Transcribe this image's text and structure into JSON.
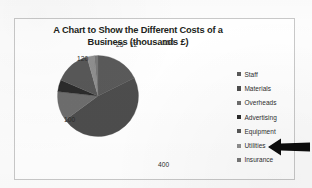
{
  "chart_data": {
    "type": "pie",
    "title": "A Chart to Show the Different Costs of a Business (thousands £)",
    "title_line1": "A Chart to Show the Different Costs of a",
    "title_line2": "Business (thousands £)",
    "unit": "thousands £",
    "categories": [
      "Staff",
      "Materials",
      "Overheads",
      "Advertising",
      "Equipment",
      "Utilities",
      "Insurance"
    ],
    "values": [
      150,
      400,
      100,
      40,
      120,
      25,
      12
    ],
    "total": 847,
    "legend_position": "right",
    "grid": false,
    "labels_shown": true,
    "slices": [
      {
        "name": "Staff",
        "value": 150,
        "label": "150",
        "color": "#5a5a5a",
        "label_x": 148,
        "label_y": 20
      },
      {
        "name": "Materials",
        "value": 400,
        "label": "400",
        "color": "#4d4d4d",
        "label_x": 143,
        "label_y": 142
      },
      {
        "name": "Overheads",
        "value": 100,
        "label": "100",
        "color": "#6e6e6e",
        "label_x": 49,
        "label_y": 97
      },
      {
        "name": "Advertising",
        "value": 40,
        "label": "40",
        "color": "#2b2b2b",
        "label_x": 52,
        "label_y": 68
      },
      {
        "name": "Equipment",
        "value": 120,
        "label": "120",
        "color": "#585858",
        "label_x": 62,
        "label_y": 36
      },
      {
        "name": "Utilities",
        "value": 25,
        "label": "25",
        "color": "#8f8f8f",
        "label_x": 101,
        "label_y": 22
      },
      {
        "name": "Insurance",
        "value": 12,
        "label": "12",
        "color": "#787878",
        "label_x": 115,
        "label_y": 22
      }
    ]
  },
  "legend": {
    "items": [
      {
        "label": "Staff",
        "color": "#5a5a5a"
      },
      {
        "label": "Materials",
        "color": "#4d4d4d"
      },
      {
        "label": "Overheads",
        "color": "#6e6e6e"
      },
      {
        "label": "Advertising",
        "color": "#2b2b2b"
      },
      {
        "label": "Equipment",
        "color": "#585858"
      },
      {
        "label": "Utilities",
        "color": "#8f8f8f"
      },
      {
        "label": "Insurance",
        "color": "#787878"
      }
    ]
  },
  "annotation": {
    "arrow": "left-pointing-arrow",
    "points_at": "Utilities",
    "color": "#000000"
  },
  "colors": {
    "frame_border": "#c9c9c9",
    "page_background": "#fdfdfd",
    "plot_background": "#ffffff",
    "title_text": "#231f20",
    "label_text": "#2b2b2b"
  }
}
